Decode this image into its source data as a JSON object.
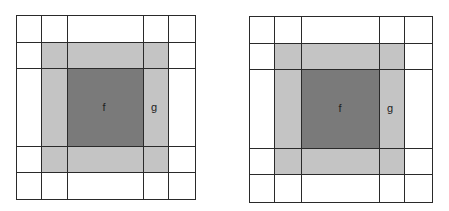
{
  "colors": {
    "background": "#ffffff",
    "outer_ring": "#c4c4c4",
    "center": "#7a7a7a",
    "grid_line": "#2a2a2a"
  },
  "diagrams": [
    {
      "id": "left",
      "x_lines": [
        16,
        41,
        67,
        143,
        168,
        195
      ],
      "y_lines": [
        15,
        42,
        68,
        146,
        172,
        199
      ],
      "labels": [
        {
          "text": "f",
          "x": 104,
          "y": 107
        },
        {
          "text": "g",
          "x": 154,
          "y": 107
        }
      ]
    },
    {
      "id": "right",
      "x_lines": [
        249,
        274,
        301,
        379,
        404,
        432
      ],
      "y_lines": [
        16,
        43,
        69,
        148,
        174,
        202
      ],
      "labels": [
        {
          "text": "f",
          "x": 340,
          "y": 108
        },
        {
          "text": "g",
          "x": 390,
          "y": 108
        }
      ]
    }
  ],
  "labels": {
    "left_f": "f",
    "left_g": "g",
    "right_f": "f",
    "right_g": "g"
  }
}
